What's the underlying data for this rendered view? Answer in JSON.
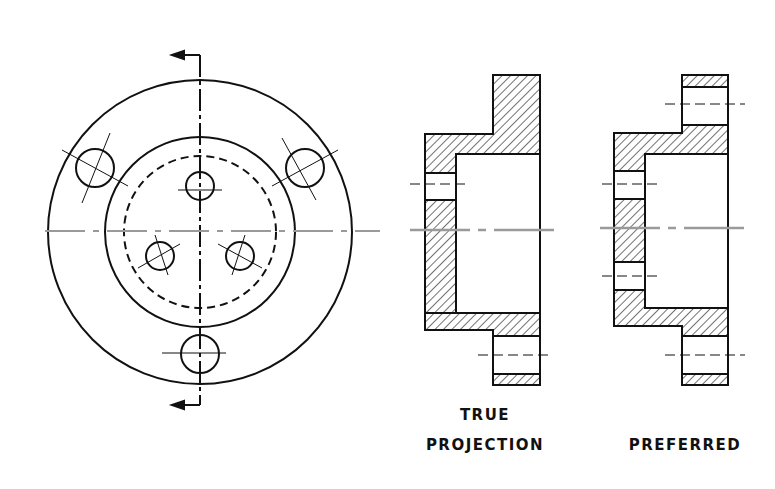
{
  "figure": {
    "ink_color": "#111111",
    "centerline_color": "#9a9a9a",
    "views": [
      {
        "id": "circular-view",
        "label": ""
      },
      {
        "id": "true-projection",
        "label_line1": "TRUE",
        "label_line2": "PROJECTION"
      },
      {
        "id": "preferred",
        "label_line1": "PREFERRED"
      }
    ]
  }
}
